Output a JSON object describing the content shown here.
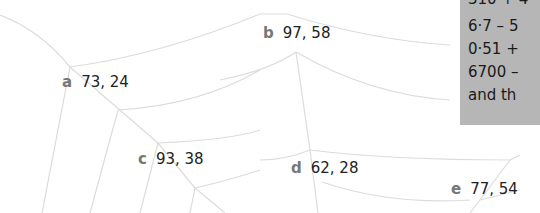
{
  "web_labels": [
    {
      "letter": "a",
      "value": "73, 24"
    },
    {
      "letter": "b",
      "value": "97, 58"
    },
    {
      "letter": "c",
      "value": "93, 38"
    },
    {
      "letter": "d",
      "value": "62, 28"
    },
    {
      "letter": "e",
      "value": "77, 54"
    }
  ],
  "panel": {
    "background": "#b6b6b6",
    "lines": [
      "310 + 4",
      "6·7 – 5",
      "0·51 +",
      "6700 –",
      "and th"
    ]
  }
}
